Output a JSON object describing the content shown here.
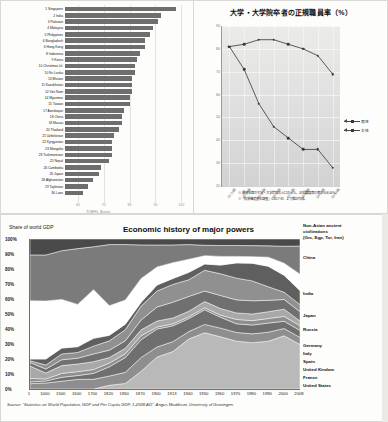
{
  "toefl": {
    "x_title": "TOEFL Score",
    "x_ticks": [
      "60",
      "70",
      "80",
      "90",
      "100"
    ],
    "x_min": 55,
    "x_max": 103,
    "rows": [
      {
        "label": "1 Singapore",
        "value": 98
      },
      {
        "label": "2 India",
        "value": 92
      },
      {
        "label": "3 Pakistan",
        "value": 91
      },
      {
        "label": "4 Malaysia",
        "value": 89
      },
      {
        "label": "5 Philippines",
        "value": 88
      },
      {
        "label": "6 Bangladesh",
        "value": 86
      },
      {
        "label": "6 Hong Kong",
        "value": 86
      },
      {
        "label": "8 Indonesia",
        "value": 84
      },
      {
        "label": "9 Korea",
        "value": 83
      },
      {
        "label": "10 Christmas Isl.",
        "value": 82
      },
      {
        "label": "10 Sri Lanka",
        "value": 82
      },
      {
        "label": "13 Bhutan",
        "value": 81
      },
      {
        "label": "11 Kazakhstan",
        "value": 81
      },
      {
        "label": "12 Viet Nam",
        "value": 81
      },
      {
        "label": "14 Myanmar",
        "value": 80
      },
      {
        "label": "15 Taiwan",
        "value": 80
      },
      {
        "label": "17 Azerbaijan",
        "value": 78
      },
      {
        "label": "18 China",
        "value": 77
      },
      {
        "label": "18 Macao",
        "value": 77
      },
      {
        "label": "20 Thailand",
        "value": 76
      },
      {
        "label": "21 Uzbekistan",
        "value": 74
      },
      {
        "label": "22 Kyrgyzstan",
        "value": 73
      },
      {
        "label": "23 Mongolia",
        "value": 73
      },
      {
        "label": "23 Turkmenistan",
        "value": 73
      },
      {
        "label": "25 Nepal",
        "value": 72
      },
      {
        "label": "26 Cambodia",
        "value": 69
      },
      {
        "label": "26 Japan",
        "value": 68
      },
      {
        "label": "28 Afghanistan",
        "value": 66
      },
      {
        "label": "29 Tajikistan",
        "value": 64
      },
      {
        "label": "30 Laos",
        "value": 62
      }
    ]
  },
  "jp_chart": {
    "title": "大学・大学院卒者の正規職員率（%）",
    "y_ticks": [
      "90",
      "80",
      "70",
      "60",
      "50",
      "40",
      "30",
      "20"
    ],
    "y_min": 20,
    "y_max": 90,
    "x_labels": [
      "20-24歳",
      "25-29歳",
      "30-34歳",
      "35-39歳",
      "40-44歳",
      "45-49歳",
      "50-54歳",
      "55-59歳"
    ],
    "legend": [
      {
        "label": "男性",
        "marker": "arrow-line"
      },
      {
        "label": "女性",
        "marker": "arrow-line"
      }
    ],
    "notes": [
      "※ 最終学歴が大学・大学院卒の人口のうち、正規職員等の者が占める%。",
      "※「就業構造基本調査」（2017年）より推計作成。"
    ],
    "series": [
      {
        "name": "男性",
        "values": [
          81,
          82,
          84,
          84,
          82,
          80,
          77,
          69
        ]
      },
      {
        "name": "女性",
        "values": [
          81,
          71,
          56,
          46,
          41,
          36,
          36,
          28
        ]
      }
    ]
  },
  "eco_chart": {
    "title": "Economic history of major powers",
    "share_label": "Share of world GDP",
    "y_ticks": [
      "100%",
      "90%",
      "80%",
      "70%",
      "60%",
      "50%",
      "40%",
      "30%",
      "20%",
      "10%",
      "0%"
    ],
    "x_labels": [
      "1",
      "1000",
      "1500",
      "1600",
      "1700",
      "1820",
      "1850",
      "1870",
      "1900",
      "1913",
      "1940",
      "1950",
      "1960",
      "1970",
      "1980",
      "1990",
      "2000",
      "2008"
    ],
    "source": "Source: \"Statistics on World Population, GDP and Per Capita GDP, 1-2008 AD\". Angus Maddison, University of Groningen.",
    "legend": [
      "Non-Asian ancient",
      "civilizations",
      "(Grc, Egp, Tur, Iran)",
      "China",
      "India",
      "Japan",
      "Russia",
      "Germany",
      "Italy",
      "Spain",
      "United Kindom",
      "France",
      "United States"
    ]
  },
  "chart_data": [
    {
      "type": "bar",
      "title": "",
      "xlabel": "TOEFL Score",
      "ylabel": "",
      "orientation": "horizontal",
      "xlim": [
        55,
        103
      ],
      "grid": true,
      "categories": [
        "1 Singapore",
        "2 India",
        "3 Pakistan",
        "4 Malaysia",
        "5 Philippines",
        "6 Bangladesh",
        "6 Hong Kong",
        "8 Indonesia",
        "9 Korea",
        "10 Christmas Isl.",
        "10 Sri Lanka",
        "13 Bhutan",
        "11 Kazakhstan",
        "12 Viet Nam",
        "14 Myanmar",
        "15 Taiwan",
        "17 Azerbaijan",
        "18 China",
        "18 Macao",
        "20 Thailand",
        "21 Uzbekistan",
        "22 Kyrgyzstan",
        "23 Mongolia",
        "23 Turkmenistan",
        "25 Nepal",
        "26 Cambodia",
        "26 Japan",
        "28 Afghanistan",
        "29 Tajikistan",
        "30 Laos"
      ],
      "values": [
        98,
        92,
        91,
        89,
        88,
        86,
        86,
        84,
        83,
        82,
        82,
        81,
        81,
        81,
        80,
        80,
        78,
        77,
        77,
        76,
        74,
        73,
        73,
        73,
        72,
        69,
        68,
        66,
        64,
        62
      ]
    },
    {
      "type": "line",
      "title": "大学・大学院卒者の正規職員率（%）",
      "xlabel": "",
      "ylabel": "%",
      "ylim": [
        20,
        90
      ],
      "grid": true,
      "legend_position": "right",
      "categories": [
        "20-24歳",
        "25-29歳",
        "30-34歳",
        "35-39歳",
        "40-44歳",
        "45-49歳",
        "50-54歳",
        "55-59歳"
      ],
      "series": [
        {
          "name": "男性",
          "values": [
            81,
            82,
            84,
            84,
            82,
            80,
            77,
            69
          ]
        },
        {
          "name": "女性",
          "values": [
            81,
            71,
            56,
            46,
            41,
            36,
            36,
            28
          ]
        }
      ]
    },
    {
      "type": "area",
      "title": "Economic history of major powers",
      "xlabel": "",
      "ylabel": "Share of world GDP",
      "ylim": [
        0,
        100
      ],
      "stacked": true,
      "normalized": true,
      "legend_position": "right",
      "x": [
        "1",
        "1000",
        "1500",
        "1600",
        "1700",
        "1820",
        "1850",
        "1870",
        "1900",
        "1913",
        "1940",
        "1950",
        "1960",
        "1970",
        "1980",
        "1990",
        "2000",
        "2008"
      ],
      "series": [
        {
          "name": "United States",
          "values": [
            0,
            0,
            0,
            0,
            0,
            2,
            3,
            9,
            16,
            19,
            27,
            27,
            24,
            22,
            21,
            21,
            22,
            19
          ]
        },
        {
          "name": "France",
          "values": [
            3,
            3,
            4,
            5,
            5,
            5,
            6,
            7,
            5,
            5,
            4,
            4,
            4,
            4,
            4,
            4,
            3,
            3
          ]
        },
        {
          "name": "United Kindom",
          "values": [
            1,
            1,
            2,
            2,
            3,
            5,
            8,
            9,
            9,
            8,
            7,
            7,
            5,
            4,
            4,
            4,
            3,
            3
          ]
        },
        {
          "name": "Spain",
          "values": [
            2,
            1,
            2,
            2,
            2,
            2,
            2,
            2,
            1,
            1,
            1,
            1,
            1,
            2,
            2,
            2,
            2,
            2
          ]
        },
        {
          "name": "Italy",
          "values": [
            7,
            3,
            4,
            4,
            4,
            3,
            3,
            3,
            3,
            3,
            3,
            3,
            3,
            3,
            3,
            3,
            3,
            2
          ]
        },
        {
          "name": "Germany",
          "values": [
            2,
            2,
            3,
            3,
            4,
            4,
            4,
            5,
            7,
            8,
            8,
            5,
            6,
            6,
            6,
            5,
            4,
            4
          ]
        },
        {
          "name": "Russia",
          "values": [
            1,
            2,
            3,
            3,
            4,
            5,
            6,
            7,
            8,
            9,
            9,
            10,
            10,
            10,
            9,
            6,
            3,
            3
          ]
        },
        {
          "name": "Japan",
          "values": [
            1,
            3,
            3,
            3,
            4,
            3,
            3,
            2,
            3,
            3,
            4,
            3,
            4,
            7,
            8,
            9,
            7,
            6
          ]
        },
        {
          "name": "India",
          "values": [
            33,
            29,
            25,
            22,
            25,
            16,
            13,
            12,
            9,
            8,
            7,
            4,
            4,
            3,
            3,
            4,
            5,
            7
          ]
        },
        {
          "name": "China",
          "values": [
            26,
            23,
            25,
            29,
            22,
            33,
            30,
            17,
            11,
            9,
            8,
            5,
            5,
            5,
            5,
            5,
            7,
            12
          ]
        },
        {
          "name": "Non-Asian ancient civilizations (Grc, Egp, Tur, Iran)",
          "values": [
            9,
            8,
            6,
            5,
            4,
            3,
            3,
            3,
            3,
            3,
            3,
            3,
            3,
            3,
            3,
            3,
            3,
            3
          ]
        }
      ]
    }
  ]
}
